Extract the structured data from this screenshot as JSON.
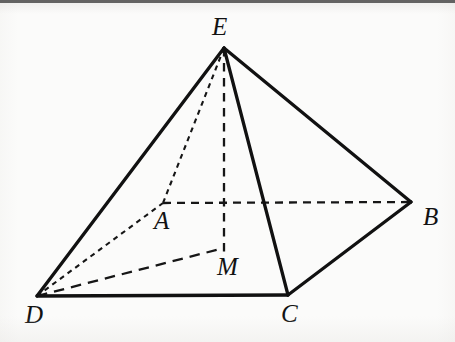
{
  "figure": {
    "width": 455,
    "height": 342,
    "background_color": "#fbfbfa",
    "stroke_color": "#111111",
    "solid_stroke_width": 3.2,
    "dashed_stroke_width": 2.2
  },
  "vertices": [
    {
      "id": "E",
      "label": "E",
      "x": 224,
      "y": 48,
      "label_x": 212,
      "label_y": 14,
      "role": "apex"
    },
    {
      "id": "A",
      "label": "A",
      "x": 163,
      "y": 203,
      "label_x": 154,
      "label_y": 208,
      "role": "base-back-left"
    },
    {
      "id": "B",
      "label": "B",
      "x": 411,
      "y": 202,
      "label_x": 423,
      "label_y": 204,
      "role": "base-back-right"
    },
    {
      "id": "C",
      "label": "C",
      "x": 288,
      "y": 295,
      "label_x": 281,
      "label_y": 301,
      "role": "base-front-right"
    },
    {
      "id": "D",
      "label": "D",
      "x": 37,
      "y": 296,
      "label_x": 25,
      "label_y": 302,
      "role": "base-front-left"
    },
    {
      "id": "M",
      "label": "M",
      "x": 224,
      "y": 248,
      "label_x": 217,
      "label_y": 254,
      "role": "base-center"
    }
  ],
  "edges": [
    {
      "id": "E-D",
      "from": "E",
      "to": "D",
      "style": "solid",
      "name": "edge-E-D"
    },
    {
      "id": "E-B",
      "from": "E",
      "to": "B",
      "style": "solid",
      "name": "edge-E-B"
    },
    {
      "id": "E-C",
      "from": "E",
      "to": "C",
      "style": "solid",
      "name": "edge-E-C"
    },
    {
      "id": "D-C",
      "from": "D",
      "to": "C",
      "style": "solid",
      "name": "edge-D-C"
    },
    {
      "id": "C-B",
      "from": "C",
      "to": "B",
      "style": "solid",
      "name": "edge-C-B"
    },
    {
      "id": "E-A",
      "from": "E",
      "to": "A",
      "style": "dashed-fine",
      "name": "edge-E-A"
    },
    {
      "id": "D-A",
      "from": "D",
      "to": "A",
      "style": "dashed-fine",
      "name": "edge-D-A"
    },
    {
      "id": "A-B",
      "from": "A",
      "to": "B",
      "style": "dashed-medium",
      "name": "edge-A-B"
    },
    {
      "id": "E-M",
      "from": "E",
      "to": "M",
      "style": "dashed-medium",
      "name": "edge-E-M-altitude"
    },
    {
      "id": "D-M",
      "from": "D",
      "to": "M",
      "style": "dashed-coarse",
      "name": "edge-D-M"
    }
  ]
}
